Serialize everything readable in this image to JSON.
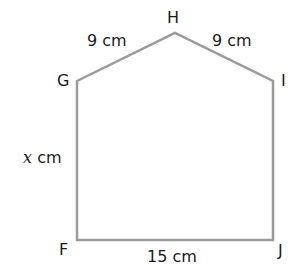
{
  "figure": {
    "type": "pentagon",
    "stroke_color": "#9a9a9a",
    "vertices": [
      {
        "name": "G",
        "x": 77,
        "y": 81
      },
      {
        "name": "H",
        "x": 175,
        "y": 33
      },
      {
        "name": "I",
        "x": 273,
        "y": 81
      },
      {
        "name": "J",
        "x": 273,
        "y": 240
      },
      {
        "name": "F",
        "x": 77,
        "y": 240
      }
    ],
    "vertex_labels": {
      "G": "G",
      "H": "H",
      "I": "I",
      "J": "J",
      "F": "F"
    },
    "side_labels": {
      "GH": "9 cm",
      "HI": "9 cm",
      "FG_variable": "x",
      "FG_unit": "cm",
      "FJ": "15 cm"
    }
  }
}
